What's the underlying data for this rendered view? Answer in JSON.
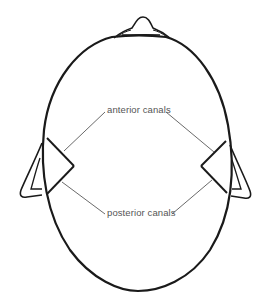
{
  "figure": {
    "labels": {
      "anterior": "anterior canals",
      "posterior": "posterior canals"
    },
    "colors": {
      "outline": "#1a1a1a",
      "leader": "#444444",
      "text": "#555555",
      "background": "#ffffff"
    }
  }
}
